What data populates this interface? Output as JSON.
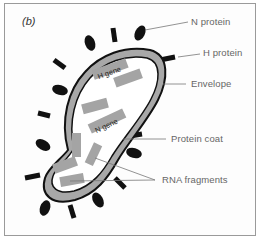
{
  "figure": {
    "panel_label": "(b)",
    "labels": {
      "n_protein": "N protein",
      "h_protein": "H protein",
      "envelope": "Envelope",
      "protein_coat": "Protein coat",
      "rna_fragments": "RNA fragments"
    },
    "gene_labels": {
      "h_gene": "H gene",
      "n_gene": "N gene"
    },
    "colors": {
      "envelope_fill": "#a8a8a8",
      "outline": "#111111",
      "spike": "#111111",
      "rna_fragment": "#a4a4a4",
      "leader_line": "#777777",
      "label_text": "#666666",
      "frame_border": "#9a9a9a"
    }
  }
}
